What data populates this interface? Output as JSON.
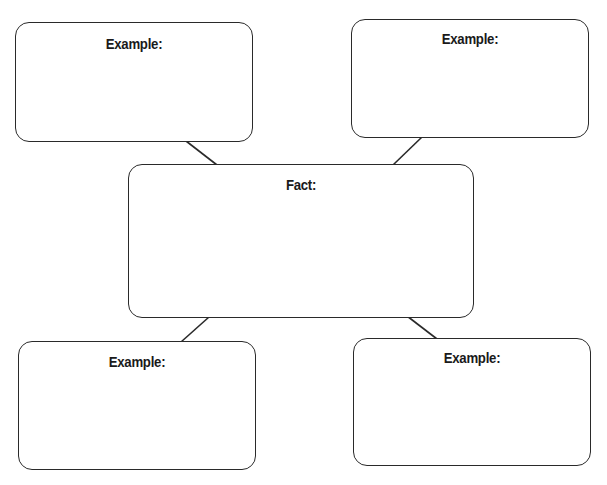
{
  "diagram": {
    "type": "fact-and-examples graphic organizer",
    "colors": {
      "stroke": "#2a2a2a",
      "text": "#1a1a1a",
      "background": "#ffffff"
    },
    "center": {
      "label": "Fact:"
    },
    "examples": [
      {
        "position": "top-left",
        "label": "Example:"
      },
      {
        "position": "top-right",
        "label": "Example:"
      },
      {
        "position": "bottom-left",
        "label": "Example:"
      },
      {
        "position": "bottom-right",
        "label": "Example:"
      }
    ],
    "connections": [
      {
        "from": "center",
        "to": "top-left"
      },
      {
        "from": "center",
        "to": "top-right"
      },
      {
        "from": "center",
        "to": "bottom-left"
      },
      {
        "from": "center",
        "to": "bottom-right"
      }
    ]
  }
}
